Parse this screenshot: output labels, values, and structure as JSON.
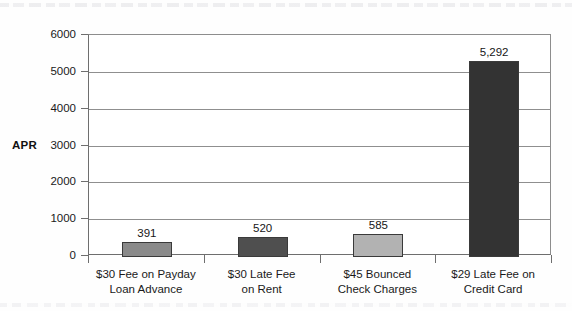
{
  "figure": {
    "background_color": "#fefefe",
    "plot_background_color": "#ffffff",
    "axis_color": "#6e6e6e",
    "gridline_color": "#8f8f8f"
  },
  "axis_title": "APR",
  "chart_data": {
    "type": "bar",
    "title": "",
    "xlabel": "",
    "ylabel": "APR",
    "ylim": [
      0,
      6000
    ],
    "yticks": [
      0,
      1000,
      2000,
      3000,
      4000,
      5000,
      6000
    ],
    "ytick_labels": [
      "0",
      "1000",
      "2000",
      "3000",
      "4000",
      "5000",
      "6000"
    ],
    "grid": true,
    "legend": false,
    "categories": [
      "$30 Fee on Payday Loan Advance",
      "$30 Late Fee on Rent",
      "$45 Bounced Check Charges",
      "$29 Late Fee on Credit Card"
    ],
    "category_lines": [
      [
        "$30 Fee on Payday",
        "Loan Advance"
      ],
      [
        "$30 Late Fee",
        "on Rent"
      ],
      [
        "$45 Bounced",
        "Check Charges"
      ],
      [
        "$29 Late Fee on",
        "Credit Card"
      ]
    ],
    "values": [
      391,
      520,
      585,
      5292
    ],
    "value_labels": [
      "391",
      "520",
      "585",
      "5,292"
    ],
    "bar_colors": [
      "#8a8a8a",
      "#4f4f4f",
      "#b2b2b2",
      "#333333"
    ],
    "bar_edge_color": "#3a3a3a"
  }
}
